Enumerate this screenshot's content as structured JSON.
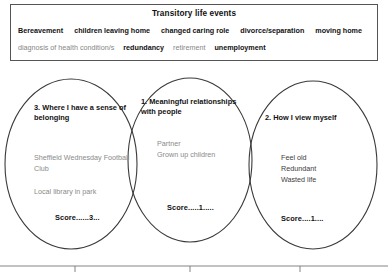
{
  "events_box": {
    "title": "Transitory life events",
    "rows": [
      [
        {
          "text": "Bereavement",
          "emphasis": "bold"
        },
        {
          "text": "children leaving home",
          "emphasis": "bold"
        },
        {
          "text": "changed caring role",
          "emphasis": "bold"
        },
        {
          "text": "divorce/separation",
          "emphasis": "bold"
        },
        {
          "text": "moving home",
          "emphasis": "bold"
        }
      ],
      [
        {
          "text": "diagnosis of health condition/s",
          "emphasis": "faded"
        },
        {
          "text": "redundancy",
          "emphasis": "bold"
        },
        {
          "text": "retirement",
          "emphasis": "faded"
        },
        {
          "text": "unemployment",
          "emphasis": "bold"
        }
      ]
    ]
  },
  "venn": {
    "left_circle": {
      "heading": "3. Where I have a sense of belonging",
      "items": "Sheffield Wednesday Football Club",
      "items2": "Local library in park",
      "score": "Score......3..."
    },
    "middle_circle": {
      "heading": "1. Meaningful relationships with people",
      "items": "Partner\nGrown up children",
      "score": "Score.....1....."
    },
    "right_circle": {
      "heading": "2. How I view myself",
      "items": "Feel old\nRedundant\nWasted life",
      "score": "Score....1...."
    }
  },
  "colors": {
    "stroke": "#3a3a3a",
    "box_border": "#555555",
    "faded_text": "#8a8a8a",
    "dark_text": "#111111",
    "rule": "#777777"
  }
}
